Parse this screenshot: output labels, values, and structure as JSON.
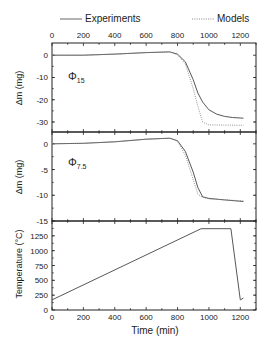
{
  "chart_data": [
    {
      "type": "line",
      "panel": "top",
      "annotation": "Φ15",
      "ylabel": "Δm (mg)",
      "xlabel": "Time (min)",
      "xlim": [
        0,
        1300
      ],
      "ylim": [
        -34.5,
        5.5
      ],
      "xticks": [
        0,
        200,
        400,
        600,
        800,
        1000,
        1200
      ],
      "yticks": [
        0,
        -10,
        -20,
        -30
      ],
      "series": [
        {
          "name": "Experiments",
          "style": "solid",
          "x": [
            0,
            200,
            400,
            600,
            750,
            800,
            850,
            900,
            930,
            960,
            1000,
            1050,
            1100,
            1150,
            1220
          ],
          "y": [
            0,
            0,
            0.5,
            1.2,
            1.5,
            0.5,
            -3,
            -11,
            -17,
            -21,
            -24.5,
            -26.5,
            -27.5,
            -28,
            -28.3
          ]
        },
        {
          "name": "Models",
          "style": "dotted",
          "x": [
            0,
            200,
            400,
            600,
            750,
            800,
            850,
            900,
            930,
            960,
            1000,
            1100,
            1220
          ],
          "y": [
            0,
            0,
            0.5,
            1.2,
            1.5,
            0.2,
            -4,
            -15,
            -23,
            -30,
            -31.3,
            -31.4,
            -31.5
          ]
        }
      ]
    },
    {
      "type": "line",
      "panel": "middle",
      "annotation": "Φ7.5",
      "ylabel": "Δm (mg)",
      "xlabel": "Time (min)",
      "xlim": [
        0,
        1300
      ],
      "ylim": [
        -15,
        2.3
      ],
      "xticks": [
        0,
        200,
        400,
        600,
        800,
        1000,
        1200
      ],
      "yticks": [
        0,
        -5,
        -10,
        -15
      ],
      "series": [
        {
          "name": "Experiments",
          "style": "solid",
          "x": [
            0,
            200,
            400,
            600,
            750,
            800,
            850,
            900,
            930,
            960,
            1000,
            1100,
            1220
          ],
          "y": [
            0,
            0.1,
            0.4,
            0.9,
            1.1,
            0.6,
            -1.5,
            -5.5,
            -8.5,
            -10.3,
            -10.6,
            -10.9,
            -11.2
          ]
        },
        {
          "name": "Models",
          "style": "dotted",
          "x": [
            0,
            200,
            400,
            600,
            750,
            800,
            850,
            900,
            930,
            960,
            1000,
            1100,
            1220
          ],
          "y": [
            0,
            0.1,
            0.4,
            0.9,
            1.1,
            0.5,
            -2.2,
            -7,
            -9.8,
            -10.4,
            -10.7,
            -10.9,
            -11.1
          ]
        }
      ]
    },
    {
      "type": "line",
      "panel": "bottom",
      "ylabel": "Temperature (°C)",
      "xlabel": "Time (min)",
      "xlim": [
        0,
        1300
      ],
      "ylim": [
        0,
        1500
      ],
      "xticks": [
        0,
        200,
        400,
        600,
        800,
        1000,
        1200
      ],
      "yticks": [
        0,
        250,
        500,
        750,
        1000,
        1250
      ],
      "series": [
        {
          "name": "Temperature",
          "style": "solid",
          "x": [
            0,
            950,
            1140,
            1200,
            1220
          ],
          "y": [
            170,
            1370,
            1370,
            170,
            200
          ]
        }
      ]
    }
  ],
  "legend": {
    "experiments": "Experiments",
    "models": "Models"
  },
  "axes": {
    "top_xticks": [
      "0",
      "200",
      "400",
      "600",
      "800",
      "1000",
      "1200"
    ],
    "bottom_xticks": [
      "0",
      "200",
      "400",
      "600",
      "800",
      "1000",
      "1200"
    ],
    "p1_yticks": [
      "0",
      "-10",
      "-20",
      "-30"
    ],
    "p2_yticks": [
      "0",
      "-5",
      "-10",
      "-15"
    ],
    "p3_yticks": [
      "0",
      "250",
      "500",
      "750",
      "1000",
      "1250"
    ],
    "p1_ylabel": "Δm (mg)",
    "p2_ylabel": "Δm (mg)",
    "p3_ylabel": "Temperature (°C)",
    "xlabel": "Time (min)",
    "p1_annot_main": "Φ",
    "p1_annot_sub": "15",
    "p2_annot_main": "Φ",
    "p2_annot_sub": "7.5"
  }
}
